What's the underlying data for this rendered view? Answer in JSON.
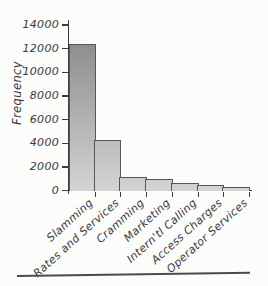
{
  "chart_data": {
    "type": "bar",
    "title": "",
    "xlabel": "",
    "ylabel": "Frequency",
    "categories": [
      "Slamming",
      "Rates and Services",
      "Cramming",
      "Marketing",
      "Intern'tl Calling",
      "Access Charges",
      "Operator Services"
    ],
    "values": [
      12450,
      4300,
      1200,
      1000,
      700,
      500,
      350
    ],
    "ylim": [
      0,
      14000
    ],
    "yticks": [
      0,
      2000,
      4000,
      6000,
      8000,
      10000,
      12000,
      14000
    ],
    "grid": false,
    "legend": "none",
    "bar_style": "gray vertical gradient, dark outline, hand-drawn oblique labels rotated 42deg"
  },
  "colors": {
    "bar_top": "#858585",
    "bar_bottom": "#d4d4d4",
    "bar_border": "#575757",
    "axis": "#3d3d3d",
    "text": "#3a3a3a",
    "background": "#fcfcfb",
    "rule": "#4a4a4a"
  }
}
